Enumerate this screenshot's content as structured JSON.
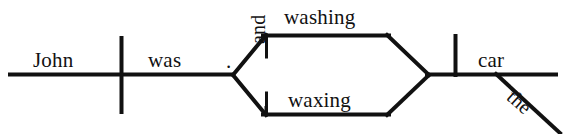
{
  "diagram": {
    "type": "reed-kellogg-sentence-diagram",
    "sentence": "John was washing and waxing the car.",
    "labels": {
      "subject": "John",
      "verb": "was",
      "period": ".",
      "conjunction": "and",
      "compound_verb_1": "washing",
      "compound_verb_2": "waxing",
      "object": "car",
      "article": "the"
    },
    "ink_color": "#111111",
    "background_color": "#ffffff"
  }
}
